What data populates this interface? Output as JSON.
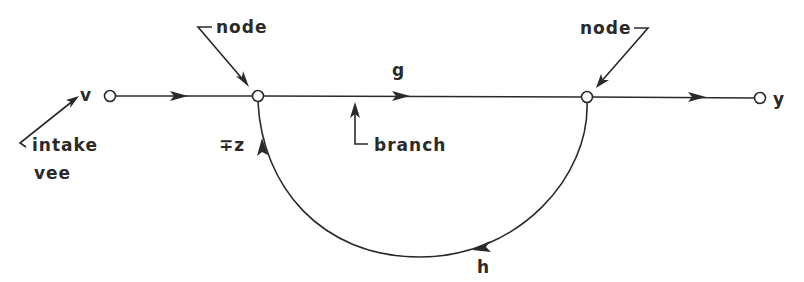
{
  "diagram": {
    "type": "signal-flow-graph",
    "labels": {
      "input": "v",
      "output": "y",
      "forward_gain": "g",
      "feedback_gain": "h",
      "feedback_sign": "∓z",
      "node_left": "node",
      "node_right": "node",
      "branch": "branch",
      "intake_line1": "intake",
      "intake_line2": "vee"
    },
    "nodes": [
      "input",
      "summing-node",
      "pickoff-node",
      "output"
    ],
    "branches": [
      {
        "from": "input",
        "to": "summing-node",
        "direction": "forward"
      },
      {
        "from": "summing-node",
        "to": "pickoff-node",
        "gain": "g",
        "direction": "forward"
      },
      {
        "from": "pickoff-node",
        "to": "output",
        "direction": "forward"
      },
      {
        "from": "pickoff-node",
        "to": "summing-node",
        "gain": "h",
        "sign": "∓z",
        "direction": "feedback"
      }
    ]
  }
}
